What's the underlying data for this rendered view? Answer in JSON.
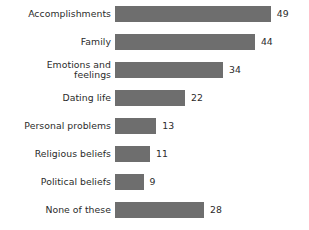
{
  "chart_data": {
    "type": "bar",
    "orientation": "horizontal",
    "title": "",
    "subtitle": "",
    "xlabel": "",
    "ylabel": "",
    "grid": false,
    "legend": false,
    "axis_visible": false,
    "xlim": [
      0,
      49
    ],
    "categories": [
      "Accomplishments",
      "Family",
      "Emotions and\nfeelings",
      "Dating life",
      "Personal problems",
      "Religious beliefs",
      "Political beliefs",
      "None of these"
    ],
    "values": [
      49,
      44,
      34,
      22,
      13,
      11,
      9,
      28
    ],
    "value_labels": [
      "49",
      "44",
      "34",
      "22",
      "13",
      "11",
      "9",
      "28"
    ],
    "colors": {
      "bar": "#6e6e6e",
      "text": "#2b2b2b",
      "background": "#ffffff"
    }
  }
}
